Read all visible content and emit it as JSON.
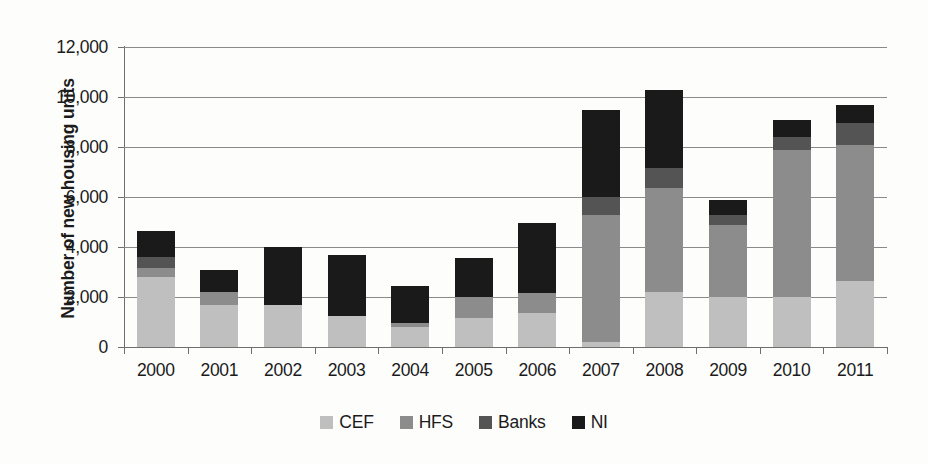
{
  "chart_data": {
    "type": "bar",
    "subtype": "stacked-vertical",
    "title": "",
    "xlabel": "",
    "ylabel": "Number of new housing units",
    "ylim": [
      0,
      12000
    ],
    "ytick_step": 2000,
    "ytick_labels": [
      "12,000",
      "10,000",
      "8,000",
      "6,000",
      "4,000",
      "2,000",
      "0"
    ],
    "ytick_values": [
      12000,
      10000,
      8000,
      6000,
      4000,
      2000,
      0
    ],
    "grid": true,
    "legend_position": "bottom",
    "categories": [
      "2000",
      "2001",
      "2002",
      "2003",
      "2004",
      "2005",
      "2006",
      "2007",
      "2008",
      "2009",
      "2010",
      "2011"
    ],
    "series": [
      {
        "name": "CEF",
        "color": "#bfbfbf",
        "values": [
          2800,
          1700,
          1700,
          1250,
          800,
          1150,
          1350,
          200,
          2200,
          2000,
          2000,
          2650
        ]
      },
      {
        "name": "HFS",
        "color": "#8c8c8c",
        "values": [
          350,
          500,
          0,
          0,
          150,
          850,
          800,
          5100,
          4150,
          2900,
          5900,
          5450
        ]
      },
      {
        "name": "Banks",
        "color": "#545454",
        "values": [
          450,
          0,
          0,
          0,
          0,
          0,
          0,
          700,
          800,
          400,
          500,
          850
        ]
      },
      {
        "name": "NI",
        "color": "#1a1a1a",
        "values": [
          1050,
          900,
          2300,
          2450,
          1500,
          1550,
          2800,
          3500,
          3150,
          600,
          700,
          750
        ]
      }
    ],
    "totals": [
      4650,
      3100,
      4000,
      3700,
      2450,
      3550,
      4950,
      9500,
      10300,
      5900,
      9100,
      9700
    ]
  },
  "legend": {
    "items": [
      {
        "label": "CEF",
        "color": "#bfbfbf"
      },
      {
        "label": "HFS",
        "color": "#8c8c8c"
      },
      {
        "label": "Banks",
        "color": "#545454"
      },
      {
        "label": "NI",
        "color": "#1a1a1a"
      }
    ]
  }
}
